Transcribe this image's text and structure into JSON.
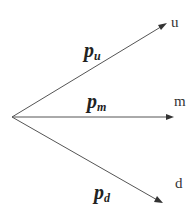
{
  "diagram": {
    "type": "trinomial-branching",
    "origin": {
      "x": 12,
      "y": 117
    },
    "branches": [
      {
        "id": "up",
        "probability_symbol": "p",
        "probability_subscript": "u",
        "end_label": "u",
        "tip": {
          "x": 166,
          "y": 24
        }
      },
      {
        "id": "middle",
        "probability_symbol": "p",
        "probability_subscript": "m",
        "end_label": "m",
        "tip": {
          "x": 173,
          "y": 117
        }
      },
      {
        "id": "down",
        "probability_symbol": "p",
        "probability_subscript": "d",
        "end_label": "d",
        "tip": {
          "x": 162,
          "y": 203
        }
      }
    ],
    "colors": {
      "line": "#555555",
      "text": "#222222",
      "background": "#ffffff"
    }
  }
}
